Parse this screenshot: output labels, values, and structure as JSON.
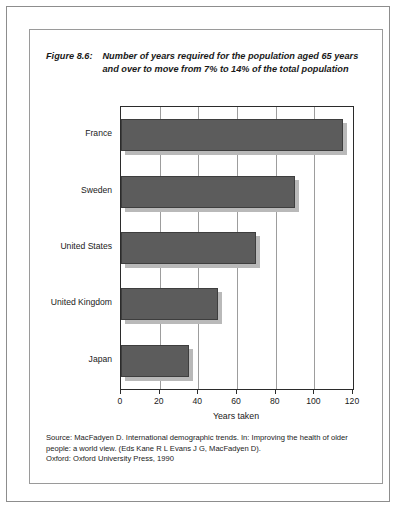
{
  "figure": {
    "label": "Figure 8.6:",
    "caption": "Number of years required for the population aged 65 years and over to move from 7% to 14% of the total population"
  },
  "source": {
    "line1": "Source: MacFadyen D. International demographic trends. In: Improving the health of older",
    "line2": "people: a world view. (Eds Kane R L Evans J G, MacFadyen D).",
    "line3": "Oxford: Oxford University Press, 1990"
  },
  "chart_data": {
    "type": "bar",
    "orientation": "horizontal",
    "title": "Number of years required for the population aged 65 years and over to move from 7% to 14% of the total population",
    "categories": [
      "France",
      "Sweden",
      "United States",
      "United Kingdom",
      "Japan"
    ],
    "values": [
      115,
      90,
      70,
      50,
      35
    ],
    "xlabel": "Years taken",
    "ylabel": "",
    "xlim": [
      0,
      120
    ],
    "xticks": [
      0,
      20,
      40,
      60,
      80,
      100,
      120
    ],
    "xtick_labels": [
      "0",
      "20",
      "40",
      "60",
      "80",
      "100",
      "120"
    ],
    "grid": "vertical",
    "legend": "none",
    "bar_color": "#5c5c5c",
    "bar_shadow_color": "#b9b9b9"
  }
}
